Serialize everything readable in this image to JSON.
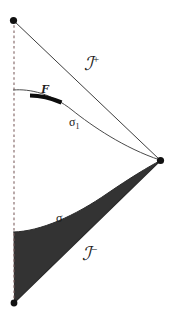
{
  "figure": {
    "background_color": "#ffffff",
    "width": 172,
    "height": 324
  },
  "labels": {
    "scri_plus": {
      "text": "ℐ",
      "superscript": "+",
      "name": "scri-plus"
    },
    "scri_minus": {
      "text": "ℐ",
      "superscript": "−",
      "name": "scri-minus"
    },
    "region_F": {
      "text": "F"
    },
    "sigma_one": {
      "text": "σ",
      "subscript": "1"
    },
    "sigma": {
      "text": "σ"
    }
  },
  "colors": {
    "ink": "#1a1a1a",
    "line": "#2b2b2b",
    "thin_line": "#4a4a4a",
    "shaded_region": "#333333",
    "dashed_axis": "#7a5c5c",
    "vertex_dot": "#111111",
    "background": "#ffffff"
  },
  "geometry": {
    "top_vertex": {
      "x": 13,
      "y": 20
    },
    "right_vertex": {
      "x": 160,
      "y": 160
    },
    "bottom_vertex": {
      "x": 14,
      "y": 303
    },
    "axis_line": {
      "x": 14,
      "y_top": 20,
      "y_bottom": 303,
      "style": "dashed"
    },
    "scri_plus_line": {
      "from": [
        13,
        20
      ],
      "to": [
        160,
        160
      ]
    },
    "scri_minus_line": {
      "from": [
        14,
        303
      ],
      "to": [
        160,
        160
      ]
    },
    "sigma_one_curve": {
      "start": [
        14,
        90
      ],
      "end": [
        160,
        160
      ],
      "style": "curve"
    },
    "sigma_curve": {
      "start": [
        14,
        232
      ],
      "end": [
        160,
        160
      ],
      "style": "curve"
    },
    "F_segment": {
      "from": [
        30,
        96
      ],
      "to": [
        61,
        102
      ],
      "thickness": 4
    },
    "shaded_region_fill": "#333333"
  }
}
